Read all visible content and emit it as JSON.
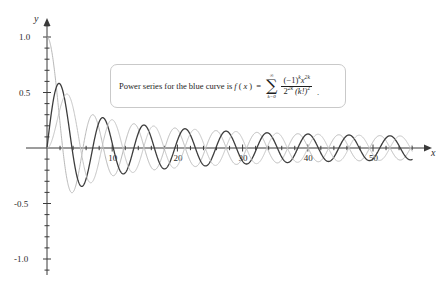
{
  "chart_data": {
    "type": "line",
    "title": "",
    "xlabel": "x",
    "ylabel": "y",
    "xlim": [
      -1,
      57
    ],
    "ylim": [
      -1.15,
      1.15
    ],
    "grid": false,
    "legend_position": "none",
    "x_ticks_major": [
      10,
      20,
      30,
      40,
      50
    ],
    "x_tick_labels": [
      "10",
      "20",
      "30",
      "40",
      "50"
    ],
    "x_tick_minor_step": 2,
    "y_ticks_major": [
      1.0,
      0.5,
      -0.5,
      -1.0
    ],
    "y_tick_labels": [
      "1.0",
      "0.5",
      "-0.5",
      "-1.0"
    ],
    "y_tick_minor_step": 0.1,
    "series": [
      {
        "name": "blue-curve-J0",
        "color": "#b9b9b9",
        "width": 1.0,
        "description": "Power series curve f(x), value 1 at x=0, decaying oscillation",
        "kind": "bessel_j0"
      },
      {
        "name": "dark-curve-J1",
        "color": "#3d3d3d",
        "width": 1.3,
        "description": "Dark decaying oscillation, first peak about 0.58 near x=1.8",
        "kind": "bessel_j1"
      },
      {
        "name": "light-curve-J2",
        "color": "#c4c4c4",
        "width": 1.0,
        "description": "Light decaying oscillation, first peak about 0.49 near x=3.1",
        "kind": "bessel_j2"
      }
    ]
  },
  "callout": {
    "lead_text": "Power series for the blue curve is",
    "fn_name": "f",
    "fn_arg_open": "(",
    "fn_var": "x",
    "fn_arg_close": ")",
    "equals": "=",
    "sum_upper": "∞",
    "sum_sign": "∑",
    "sum_lower_k": "k",
    "sum_lower_eq": "=",
    "sum_lower_val": "0",
    "numerator_base": "(−1)",
    "numerator_exp1": "k",
    "numerator_var": "x",
    "numerator_exp2": "2k",
    "denominator_base": "2",
    "denominator_exp1": "2k",
    "denominator_factorial": "(k!)",
    "denominator_exp2": "2",
    "trailing_period": "."
  },
  "axes": {
    "x_label": "x",
    "y_label": "y"
  },
  "colors": {
    "axis": "#3a3a3a",
    "dark_curve": "#3d3d3d",
    "mid_gray_curve": "#b9b9b9",
    "light_gray_curve": "#c4c4c4",
    "callout_border": "#c9c9c9",
    "text": "#1d1d1d",
    "background": "#ffffff"
  }
}
